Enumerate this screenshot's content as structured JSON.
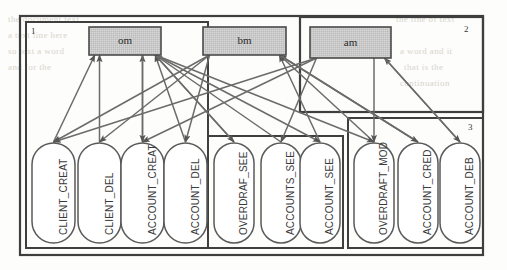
{
  "figure": {
    "kind": "use-case-module-relation-diagram",
    "background_color": "#fdfdfb",
    "line_color": "#6b6b6b",
    "arrow_color": "#555555",
    "box_fill": "#c9c9c9",
    "box_stroke": "#4a4a4a",
    "frame_color": "#3f3f3f",
    "label_color": "#3a3a3a"
  },
  "outer_frame": {
    "label": ""
  },
  "groups": [
    {
      "id": "g1",
      "number": "1",
      "number_pos": "top-left"
    },
    {
      "id": "g2",
      "number": "2",
      "number_pos": "top-right"
    },
    {
      "id": "g3",
      "number": "3",
      "number_pos": "top-right"
    }
  ],
  "modules": [
    {
      "id": "om",
      "label": "om",
      "x": 89,
      "y": 27,
      "w": 72,
      "h": 28
    },
    {
      "id": "bm",
      "label": "bm",
      "x": 203,
      "y": 27,
      "w": 83,
      "h": 28
    },
    {
      "id": "am",
      "label": "am",
      "x": 310,
      "y": 27,
      "w": 81,
      "h": 31
    }
  ],
  "use_cases": [
    {
      "id": "uc1",
      "label": "CLIENT_CREAT",
      "group": "g1",
      "x": 32,
      "y": 143,
      "w": 43,
      "h": 100
    },
    {
      "id": "uc2",
      "label": "CLIENT_DEL",
      "group": "g1",
      "x": 78,
      "y": 143,
      "w": 43,
      "h": 100
    },
    {
      "id": "uc3",
      "label": "ACCOUNT_CREAT",
      "group": "g1",
      "x": 121,
      "y": 143,
      "w": 43,
      "h": 100
    },
    {
      "id": "uc4",
      "label": "ACCOUNT_DEL",
      "group": "g1",
      "x": 164,
      "y": 143,
      "w": 43,
      "h": 100
    },
    {
      "id": "uc5",
      "label": "OVERDRAF_SEE",
      "group": "g2",
      "x": 214,
      "y": 143,
      "w": 40,
      "h": 100
    },
    {
      "id": "uc6",
      "label": "ACCOUNTS_SEE",
      "group": "g2",
      "x": 261,
      "y": 143,
      "w": 40,
      "h": 100
    },
    {
      "id": "uc7",
      "label": "ACCOUNT_SEE",
      "group": "g2",
      "x": 300,
      "y": 143,
      "w": 40,
      "h": 100
    },
    {
      "id": "uc8",
      "label": "OVERDRAFT_MOD",
      "group": "g3",
      "x": 354,
      "y": 143,
      "w": 40,
      "h": 100
    },
    {
      "id": "uc9",
      "label": "ACCOUNT_CRED",
      "group": "g3",
      "x": 398,
      "y": 143,
      "w": 40,
      "h": 100
    },
    {
      "id": "uc10",
      "label": "ACCOUNT_DEB",
      "group": "g3",
      "x": 440,
      "y": 143,
      "w": 40,
      "h": 100
    }
  ],
  "edges": [
    {
      "from": "uc1",
      "to": "om",
      "dir": "up"
    },
    {
      "from": "uc2",
      "to": "om",
      "dir": "up"
    },
    {
      "from": "uc3",
      "to": "om",
      "dir": "up"
    },
    {
      "from": "uc4",
      "to": "om",
      "dir": "up"
    },
    {
      "from": "uc5",
      "to": "om",
      "dir": "up"
    },
    {
      "from": "uc6",
      "to": "om",
      "dir": "up"
    },
    {
      "from": "uc7",
      "to": "bm",
      "dir": "up"
    },
    {
      "from": "uc8",
      "to": "bm",
      "dir": "up"
    },
    {
      "from": "uc9",
      "to": "bm",
      "dir": "up"
    },
    {
      "from": "uc10",
      "to": "am",
      "dir": "up"
    },
    {
      "from": "om",
      "to": "uc3",
      "dir": "down"
    },
    {
      "from": "om",
      "to": "uc5",
      "dir": "down"
    },
    {
      "from": "om",
      "to": "uc7",
      "dir": "down"
    },
    {
      "from": "om",
      "to": "uc8",
      "dir": "down"
    },
    {
      "from": "bm",
      "to": "uc1",
      "dir": "down"
    },
    {
      "from": "bm",
      "to": "uc2",
      "dir": "down"
    },
    {
      "from": "bm",
      "to": "uc4",
      "dir": "down"
    },
    {
      "from": "bm",
      "to": "uc9",
      "dir": "down"
    },
    {
      "from": "am",
      "to": "uc1",
      "dir": "down"
    },
    {
      "from": "am",
      "to": "uc3",
      "dir": "down"
    },
    {
      "from": "am",
      "to": "uc6",
      "dir": "down"
    },
    {
      "from": "am",
      "to": "uc8",
      "dir": "down"
    },
    {
      "from": "am",
      "to": "uc10",
      "dir": "down"
    }
  ],
  "ghost_text": [
    {
      "text": "the document text",
      "x": 8,
      "y": 14
    },
    {
      "text": "a text line here",
      "x": 8,
      "y": 30
    },
    {
      "text": "so text a word",
      "x": 8,
      "y": 46
    },
    {
      "text": "and for the",
      "x": 8,
      "y": 62
    },
    {
      "text": "the line of text",
      "x": 396,
      "y": 14
    },
    {
      "text": "a word and it",
      "x": 400,
      "y": 46
    },
    {
      "text": "that is the",
      "x": 404,
      "y": 62
    },
    {
      "text": "continuation",
      "x": 400,
      "y": 78
    }
  ]
}
